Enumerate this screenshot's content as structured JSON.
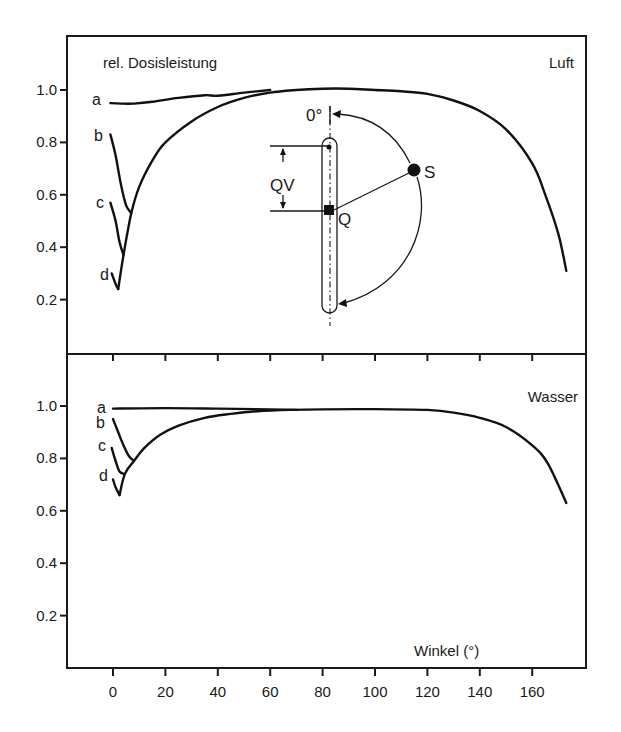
{
  "figure": {
    "y_title": "rel. Dosisleistung",
    "x_title": "Winkel (°)",
    "panels": [
      {
        "name": "Luft",
        "label": "Luft"
      },
      {
        "name": "Wasser",
        "label": "Wasser"
      }
    ],
    "diagram": {
      "zero_label": "0°",
      "qv_label": "QV",
      "q_label": "Q",
      "s_label": "S"
    }
  },
  "chart_data": [
    {
      "type": "line",
      "title": "Luft",
      "xlabel": "Winkel (°)",
      "ylabel": "rel. Dosisleistung",
      "xlim": [
        -18,
        181
      ],
      "ylim": [
        0,
        1.2
      ],
      "x_ticks": [
        0,
        20,
        40,
        60,
        80,
        100,
        120,
        140,
        160
      ],
      "y_ticks": [
        0.2,
        0.4,
        0.6,
        0.8,
        1.0
      ],
      "y_tick_labels": [
        "0.2",
        "0.4",
        "0.6",
        "0.8",
        "1.0"
      ],
      "grid": false,
      "legend": "inline curve labels a, b, c, d",
      "series": [
        {
          "name": "a",
          "x": [
            -1,
            3,
            8,
            15,
            25,
            35,
            40,
            50,
            60
          ],
          "y": [
            0.95,
            0.948,
            0.948,
            0.955,
            0.97,
            0.98,
            0.978,
            0.99,
            1.0
          ]
        },
        {
          "name": "b",
          "x": [
            -1,
            1,
            3,
            5,
            7
          ],
          "y": [
            0.83,
            0.75,
            0.64,
            0.56,
            0.53
          ]
        },
        {
          "name": "c",
          "x": [
            -1,
            1,
            2.5,
            4
          ],
          "y": [
            0.57,
            0.5,
            0.42,
            0.37
          ]
        },
        {
          "name": "d",
          "x": [
            -0.5,
            1,
            2
          ],
          "y": [
            0.3,
            0.26,
            0.24
          ]
        },
        {
          "name": "envelope",
          "x": [
            2,
            4,
            7,
            10,
            15,
            20,
            30,
            40,
            50,
            60,
            70,
            80,
            90,
            100,
            110,
            120,
            130,
            140,
            150,
            160,
            165,
            170,
            173
          ],
          "y": [
            0.24,
            0.37,
            0.53,
            0.63,
            0.73,
            0.8,
            0.88,
            0.935,
            0.97,
            0.99,
            1.0,
            1.005,
            1.005,
            1.0,
            0.995,
            0.985,
            0.96,
            0.92,
            0.85,
            0.72,
            0.6,
            0.45,
            0.31
          ]
        }
      ]
    },
    {
      "type": "line",
      "title": "Wasser",
      "xlabel": "Winkel (°)",
      "ylabel": "rel. Dosisleistung",
      "xlim": [
        -18,
        181
      ],
      "ylim": [
        0,
        1.2
      ],
      "x_ticks": [
        0,
        20,
        40,
        60,
        80,
        100,
        120,
        140,
        160
      ],
      "x_tick_labels": [
        "0",
        "20",
        "40",
        "60",
        "80",
        "100",
        "120",
        "140",
        "160"
      ],
      "y_ticks": [
        0.2,
        0.4,
        0.6,
        0.8,
        1.0
      ],
      "y_tick_labels": [
        "0.2",
        "0.4",
        "0.6",
        "0.8",
        "1.0"
      ],
      "grid": false,
      "legend": "inline curve labels a, b, c, d",
      "series": [
        {
          "name": "a",
          "x": [
            0,
            20,
            40,
            60,
            70
          ],
          "y": [
            0.99,
            0.992,
            0.99,
            0.987,
            0.985
          ]
        },
        {
          "name": "b",
          "x": [
            0,
            2,
            4,
            6,
            8
          ],
          "y": [
            0.95,
            0.9,
            0.85,
            0.81,
            0.79
          ]
        },
        {
          "name": "c",
          "x": [
            -0.5,
            1,
            2.5,
            4.5
          ],
          "y": [
            0.84,
            0.79,
            0.75,
            0.74
          ]
        },
        {
          "name": "d",
          "x": [
            0,
            1,
            2.5
          ],
          "y": [
            0.72,
            0.69,
            0.66
          ]
        },
        {
          "name": "envelope",
          "x": [
            2.5,
            4.5,
            8,
            12,
            18,
            25,
            35,
            45,
            55,
            68,
            80,
            100,
            120,
            130,
            140,
            150,
            160,
            166,
            173
          ],
          "y": [
            0.66,
            0.74,
            0.79,
            0.84,
            0.89,
            0.925,
            0.955,
            0.97,
            0.98,
            0.985,
            0.987,
            0.988,
            0.985,
            0.975,
            0.955,
            0.92,
            0.85,
            0.78,
            0.63
          ]
        }
      ]
    }
  ]
}
